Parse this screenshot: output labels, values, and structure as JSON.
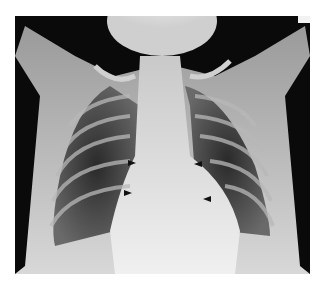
{
  "image": {
    "type": "chest-radiograph",
    "view": "frontal",
    "background": "#ffffff",
    "film_color": "#0a0a0a"
  },
  "annotations": {
    "arrowheads": [
      {
        "x": 128,
        "y": 163,
        "direction": "right"
      },
      {
        "x": 124,
        "y": 193,
        "direction": "right"
      },
      {
        "x": 194,
        "y": 164,
        "direction": "left"
      },
      {
        "x": 203,
        "y": 199,
        "direction": "left"
      }
    ]
  }
}
